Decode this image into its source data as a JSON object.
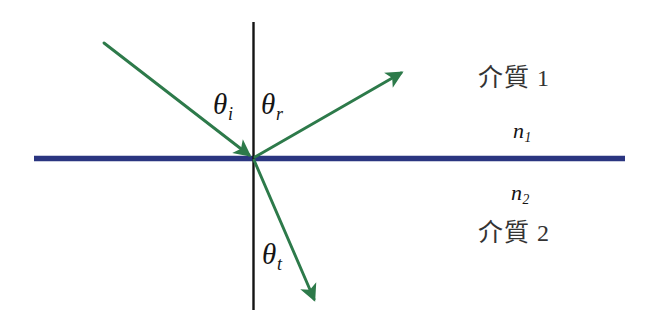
{
  "diagram": {
    "width": 657,
    "height": 329,
    "background_color": "#ffffff",
    "colors": {
      "ray": "#2d7a4a",
      "interface": "#2a3580",
      "normal": "#141414",
      "text": "#333333"
    },
    "angles": {
      "incident": "θ",
      "incident_sub": "i",
      "reflected": "θ",
      "reflected_sub": "r",
      "transmitted": "θ",
      "transmitted_sub": "t"
    },
    "indices": {
      "upper": "n",
      "upper_sub": "1",
      "lower": "n",
      "lower_sub": "2"
    },
    "media": {
      "upper_name": "介質",
      "upper_number": "1",
      "lower_name": "介質",
      "lower_number": "2"
    },
    "geometry": {
      "origin_x": 253,
      "origin_y": 158,
      "interface_x_start": 34,
      "interface_x_end": 625,
      "normal_y_top": 22,
      "normal_y_bottom": 310,
      "incident_start_x": 104,
      "incident_start_y": 43,
      "reflected_end_x": 405,
      "reflected_end_y": 70,
      "transmitted_end_x": 318,
      "transmitted_end_y": 305
    }
  }
}
